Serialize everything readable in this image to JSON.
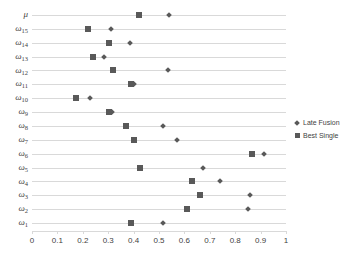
{
  "chart_data": {
    "type": "scatter",
    "title": "",
    "xlabel": "",
    "ylabel": "",
    "xlim": [
      0,
      1
    ],
    "xticks": [
      "0",
      "0.1",
      "0.2",
      "0.3",
      "0.4",
      "0.5",
      "0.6",
      "0.7",
      "0.8",
      "0.9",
      "1"
    ],
    "grid": "horizontal",
    "legend_position": "right",
    "orientation": "horizontal",
    "categories": [
      {
        "label": "μ",
        "base": "μ",
        "sub": ""
      },
      {
        "label": "ω15",
        "base": "ω",
        "sub": "15"
      },
      {
        "label": "ω14",
        "base": "ω",
        "sub": "14"
      },
      {
        "label": "ω13",
        "base": "ω",
        "sub": "13"
      },
      {
        "label": "ω12",
        "base": "ω",
        "sub": "12"
      },
      {
        "label": "ω11",
        "base": "ω",
        "sub": "11"
      },
      {
        "label": "ω10",
        "base": "ω",
        "sub": "10"
      },
      {
        "label": "ω9",
        "base": "ω",
        "sub": "9"
      },
      {
        "label": "ω8",
        "base": "ω",
        "sub": "8"
      },
      {
        "label": "ω7",
        "base": "ω",
        "sub": "7"
      },
      {
        "label": "ω6",
        "base": "ω",
        "sub": "6"
      },
      {
        "label": "ω5",
        "base": "ω",
        "sub": "5"
      },
      {
        "label": "ω4",
        "base": "ω",
        "sub": "4"
      },
      {
        "label": "ω3",
        "base": "ω",
        "sub": "3"
      },
      {
        "label": "ω2",
        "base": "ω",
        "sub": "2"
      },
      {
        "label": "ω1",
        "base": "ω",
        "sub": "1"
      }
    ],
    "series": [
      {
        "name": "Late Fusion",
        "marker": "diamond",
        "color": "#595959",
        "values": [
          0.54,
          0.31,
          0.385,
          0.285,
          0.535,
          0.4,
          0.23,
          0.315,
          0.515,
          0.57,
          0.915,
          0.675,
          0.74,
          0.86,
          0.85,
          0.515
        ]
      },
      {
        "name": "Best Single",
        "marker": "square",
        "color": "#595959",
        "values": [
          0.42,
          0.22,
          0.305,
          0.24,
          0.32,
          0.39,
          0.175,
          0.305,
          0.37,
          0.4,
          0.865,
          0.425,
          0.63,
          0.66,
          0.61,
          0.39
        ]
      }
    ]
  },
  "legend": {
    "items": [
      {
        "label": "Late Fusion",
        "marker": "diamond"
      },
      {
        "label": "Best Single",
        "marker": "square"
      }
    ]
  },
  "colors": {
    "marker": "#595959",
    "gridline": "#d9d9d9",
    "text": "#3f3f3f",
    "background": "#ffffff"
  }
}
